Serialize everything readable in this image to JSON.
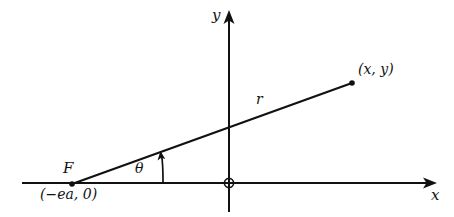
{
  "figure": {
    "type": "diagram",
    "background_color": "#ffffff",
    "stroke_color": "#111111"
  },
  "axes": {
    "x_axis": {
      "label": "x",
      "start_px": [
        22,
        183
      ],
      "end_px": [
        437,
        183
      ],
      "arrow": "right"
    },
    "y_axis": {
      "label": "y",
      "start_px": [
        229,
        212
      ],
      "end_px": [
        229,
        10
      ],
      "arrow": "up"
    },
    "origin": {
      "marker": "circle-dot",
      "position_px": [
        229,
        183
      ]
    }
  },
  "points": {
    "focus": {
      "label": "F",
      "coords_label": "(−ea, 0)",
      "position_px": [
        72,
        184
      ],
      "marker": "dot"
    },
    "point": {
      "label": "(x, y)",
      "position_px": [
        352,
        83
      ],
      "marker": "dot"
    }
  },
  "segments": {
    "radius": {
      "label": "r",
      "from_px": [
        72,
        184
      ],
      "to_px": [
        352,
        83
      ]
    }
  },
  "angles": {
    "theta": {
      "label": "θ",
      "vertex_px": [
        72,
        184
      ],
      "from_ray": "positive-x-direction",
      "to_ray": "radius",
      "arc_arrow": "counterclockwise"
    }
  }
}
